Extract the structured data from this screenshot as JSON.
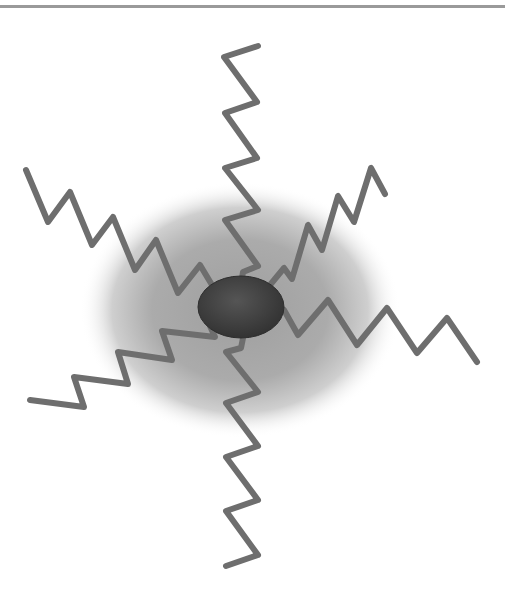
{
  "diagram": {
    "colors": {
      "top_rule": "#9a9a9a",
      "halo_center": "#a8a8a8",
      "core": "#4a4a4a",
      "core_edge": "#333333",
      "chain": "#6e6e6e"
    },
    "core": {
      "cx": 241,
      "cy": 307,
      "rx": 43,
      "ry": 31
    },
    "halo": {
      "cx": 240,
      "cy": 310,
      "rx": 160,
      "ry": 128
    },
    "chains": [
      {
        "name": "top",
        "points": "258,46 224,57 257,102 225,113 257,158 225,168 258,210 225,220 258,266 243,272 241,285"
      },
      {
        "name": "upper-left",
        "points": "26,170 48,222 70,192 92,245 113,217 135,270 156,240 178,293 200,265 212,285"
      },
      {
        "name": "upper-right",
        "points": "385,194 371,168 354,222 338,196 322,250 308,225 292,279 284,268 270,285"
      },
      {
        "name": "right",
        "points": "284,310 298,335 328,300 357,345 387,308 417,353 447,318 477,362"
      },
      {
        "name": "lower-left",
        "points": "30,400 84,407 74,377 128,384 118,352 172,360 162,331 215,337 210,326"
      },
      {
        "name": "bottom",
        "points": "243,338 241,348 226,352 258,392 226,403 258,446 226,457 258,500 226,511 258,555 226,566"
      }
    ]
  }
}
